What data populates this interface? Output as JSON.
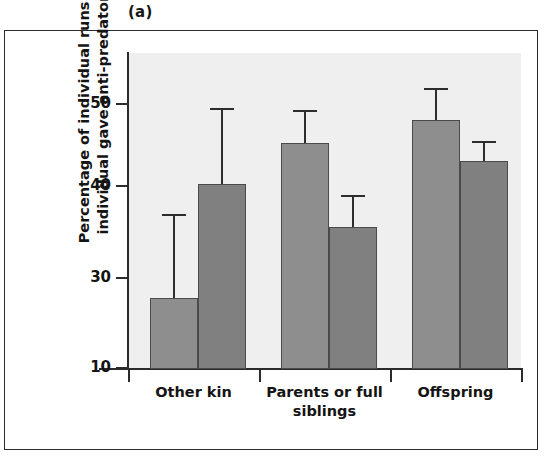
{
  "panel": {
    "label": "(a)"
  },
  "chart_data": {
    "type": "bar",
    "title": "",
    "subtitle": "",
    "panel_label": "(a)",
    "xlabel": "",
    "ylabel": "Percentage of individual runs when individual gave anti-predator call",
    "ylabel_lines": [
      "Percentage of individual runs when",
      "individual gave anti-predator call"
    ],
    "categories": [
      "Other kin",
      "Parents or full siblings",
      "Offspring"
    ],
    "category_lines": [
      [
        "Other kin"
      ],
      [
        "Parents or full",
        "siblings"
      ],
      [
        "Offspring"
      ]
    ],
    "ytick_labels": [
      "10",
      "30",
      "40",
      "50"
    ],
    "ytick_values": [
      10,
      30,
      40,
      50
    ],
    "ylim": [
      10,
      56
    ],
    "grid": false,
    "legend": "none",
    "series": [
      {
        "name": "Series 1",
        "color": "#8e8e8e",
        "values": [
          25.5,
          45.3,
          48.0
        ],
        "errors_upper": [
          37.0,
          49.3,
          52.0
        ]
      },
      {
        "name": "Series 2",
        "color": "#808080",
        "values": [
          40.3,
          35.5,
          43.0
        ],
        "errors_upper": [
          49.5,
          39.0,
          45.5
        ]
      }
    ],
    "bars": [
      {
        "group": "Other kin",
        "series": "Series 1",
        "value": 25.5,
        "error_upper": 37.0
      },
      {
        "group": "Other kin",
        "series": "Series 2",
        "value": 40.3,
        "error_upper": 49.5
      },
      {
        "group": "Parents or full siblings",
        "series": "Series 1",
        "value": 45.3,
        "error_upper": 49.3
      },
      {
        "group": "Parents or full siblings",
        "series": "Series 2",
        "value": 35.5,
        "error_upper": 39.0
      },
      {
        "group": "Offspring",
        "series": "Series 1",
        "value": 48.0,
        "error_upper": 52.0
      },
      {
        "group": "Offspring",
        "series": "Series 2",
        "value": 43.0,
        "error_upper": 45.5
      }
    ],
    "colors": {
      "bar_fill": "#8e8e8e",
      "bar_edge": "#4a4a4a",
      "plot_background": "#efefef",
      "axis": "#2b2b2b",
      "frame": "#2b2b2b",
      "text": "#141414"
    }
  }
}
